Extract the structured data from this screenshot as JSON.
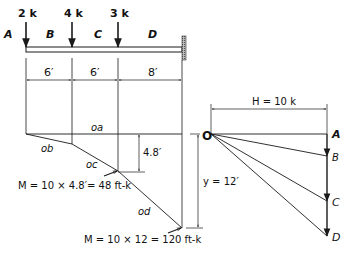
{
  "beam": {
    "loads": [
      {
        "label": "2 k",
        "x_ft": 0
      },
      {
        "label": "4 k",
        "x_ft": 6
      },
      {
        "label": "3 k",
        "x_ft": 12
      }
    ],
    "space_labels": [
      "A",
      "B",
      "C",
      "D"
    ],
    "dimensions": [
      "6′",
      "6′",
      "8′"
    ],
    "support": "fixed-wall"
  },
  "funicular": {
    "segments": [
      "oa",
      "ob",
      "oc",
      "od"
    ],
    "offset_label": "4.8′",
    "moment_at_c": "M = 10 × 4.8′= 48 ft-k",
    "moment_at_wall": "M = 10 × 12 = 120 ft-k",
    "y_label": "y = 12′"
  },
  "force_polygon": {
    "pole": "O",
    "points": [
      "A",
      "B",
      "C",
      "D"
    ],
    "H_label": "H = 10 k"
  },
  "colors": {
    "line": "#1a1a1a",
    "hatch": "#888888"
  }
}
